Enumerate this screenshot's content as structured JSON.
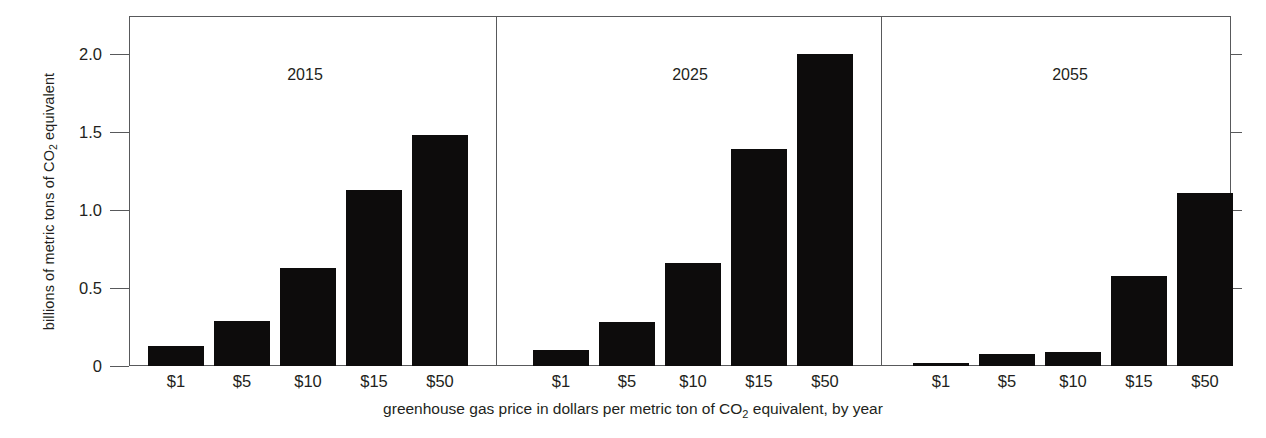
{
  "chart_data": {
    "type": "bar",
    "title": "",
    "subtitle": "",
    "xlabel": "greenhouse gas price in dollars per metric ton of CO2 equivalent, by year",
    "ylabel": "billions of metric tons of CO2 equivalent",
    "categories": [
      "$1",
      "$5",
      "$10",
      "$15",
      "$50"
    ],
    "ylim": [
      0,
      2.24
    ],
    "ytick_values": [
      0,
      0.5,
      1.0,
      1.5,
      2.0
    ],
    "ytick_labels": [
      "0",
      "0.5",
      "1.0",
      "1.5",
      "2.0"
    ],
    "grid": false,
    "legend": "none",
    "panel_layout": "three side-by-side panels sharing one y axis",
    "bar_color": "#0d0c0c",
    "axis_color": "#58595b",
    "panels": [
      {
        "name": "2015",
        "label": "2015",
        "categories": [
          "$1",
          "$5",
          "$10",
          "$15",
          "$50"
        ],
        "values": [
          0.13,
          0.29,
          0.63,
          1.13,
          1.48
        ]
      },
      {
        "name": "2025",
        "label": "2025",
        "categories": [
          "$1",
          "$5",
          "$10",
          "$15",
          "$50"
        ],
        "values": [
          0.1,
          0.28,
          0.66,
          1.39,
          2.0
        ]
      },
      {
        "name": "2055",
        "label": "2055",
        "categories": [
          "$1",
          "$5",
          "$10",
          "$15",
          "$50"
        ],
        "values": [
          0.02,
          0.08,
          0.09,
          0.58,
          1.11
        ]
      }
    ]
  },
  "axis": {
    "y_title_prefix": "billions of metric tons of CO",
    "y_title_sub": "2",
    "y_title_suffix": " equivalent",
    "x_caption_prefix": "greenhouse gas price in dollars per metric ton of CO",
    "x_caption_sub": "2",
    "x_caption_suffix": " equivalent, by year"
  },
  "ylabels": {
    "t0": "0",
    "t1": "0.5",
    "t2": "1.0",
    "t3": "1.5",
    "t4": "2.0"
  },
  "panel_titles": {
    "p0": "2015",
    "p1": "2025",
    "p2": "2055"
  },
  "xticks": {
    "c0": "$1",
    "c1": "$5",
    "c2": "$10",
    "c3": "$15",
    "c4": "$50"
  }
}
